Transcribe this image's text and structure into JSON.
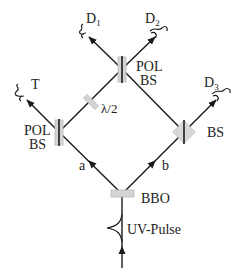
{
  "colors": {
    "line": "#1a1a1a",
    "optic_fill": "#d4d4d4",
    "optic_stroke": "#b0b0b0",
    "background": "#ffffff"
  },
  "components": {
    "top_pbs": {
      "label_line1": "POL",
      "label_line2": "BS"
    },
    "left_pbs": {
      "label_line1": "POL",
      "label_line2": "BS"
    },
    "right_bs": {
      "label": "BS"
    },
    "half_wave_plate": {
      "label": "λ/2"
    },
    "crystal": {
      "label": "BBO"
    },
    "pump": {
      "label": "UV-Pulse"
    }
  },
  "paths": {
    "a": {
      "label": "a"
    },
    "b": {
      "label": "b"
    }
  },
  "detectors": {
    "d1": {
      "label": "D",
      "subscript": "1"
    },
    "d2": {
      "label": "D",
      "subscript": "2"
    },
    "d3": {
      "label": "D",
      "subscript": "3"
    },
    "trigger": {
      "label": "T"
    }
  }
}
